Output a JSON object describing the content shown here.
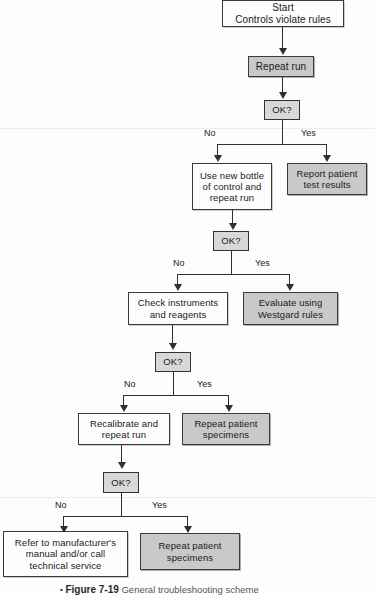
{
  "figure": {
    "bullet": "•",
    "number": "Figure 7-19",
    "caption": "General troubleshooting scheme"
  },
  "colors": {
    "shaded_fill": "#c9c9c9",
    "white_fill": "#fdfdfd",
    "decision_fill": "#d8d8d8",
    "line": "#2f2f2f",
    "border": "#3a3a3a"
  },
  "flowchart": {
    "type": "flowchart",
    "title": "General troubleshooting scheme",
    "nodes": [
      {
        "id": "start",
        "label": "Start\nControls violate rules",
        "shape": "process",
        "fill": "white"
      },
      {
        "id": "repeat_run",
        "label": "Repeat run",
        "shape": "process",
        "fill": "shaded"
      },
      {
        "id": "ok1",
        "label": "OK?",
        "shape": "decision",
        "fill": "shaded"
      },
      {
        "id": "new_bottle",
        "label": "Use new bottle\nof control and\nrepeat run",
        "shape": "process",
        "fill": "white"
      },
      {
        "id": "report",
        "label": "Report patient\ntest results",
        "shape": "process",
        "fill": "shaded"
      },
      {
        "id": "ok2",
        "label": "OK?",
        "shape": "decision",
        "fill": "shaded"
      },
      {
        "id": "check_inst",
        "label": "Check instruments\nand reagents",
        "shape": "process",
        "fill": "white"
      },
      {
        "id": "westgard",
        "label": "Evaluate using\nWestgard rules",
        "shape": "process",
        "fill": "shaded"
      },
      {
        "id": "ok3",
        "label": "OK?",
        "shape": "decision",
        "fill": "shaded"
      },
      {
        "id": "recalib",
        "label": "Recalibrate and\nrepeat run",
        "shape": "process",
        "fill": "white"
      },
      {
        "id": "repeat_sp1",
        "label": "Repeat patient\nspecimens",
        "shape": "process",
        "fill": "shaded"
      },
      {
        "id": "ok4",
        "label": "OK?",
        "shape": "decision",
        "fill": "shaded"
      },
      {
        "id": "refer",
        "label": "Refer to manufacturer's\nmanual and/or call\ntechnical service",
        "shape": "process",
        "fill": "white"
      },
      {
        "id": "repeat_sp2",
        "label": "Repeat patient\nspecimens",
        "shape": "process",
        "fill": "shaded"
      }
    ],
    "branch_labels": {
      "no": "No",
      "yes": "Yes"
    },
    "edges": [
      {
        "from": "start",
        "to": "repeat_run",
        "label": ""
      },
      {
        "from": "repeat_run",
        "to": "ok1",
        "label": ""
      },
      {
        "from": "ok1",
        "to": "new_bottle",
        "label": "No"
      },
      {
        "from": "ok1",
        "to": "report",
        "label": "Yes"
      },
      {
        "from": "new_bottle",
        "to": "ok2",
        "label": ""
      },
      {
        "from": "ok2",
        "to": "check_inst",
        "label": "No"
      },
      {
        "from": "ok2",
        "to": "westgard",
        "label": "Yes"
      },
      {
        "from": "check_inst",
        "to": "ok3",
        "label": ""
      },
      {
        "from": "ok3",
        "to": "recalib",
        "label": "No"
      },
      {
        "from": "ok3",
        "to": "repeat_sp1",
        "label": "Yes"
      },
      {
        "from": "recalib",
        "to": "ok4",
        "label": ""
      },
      {
        "from": "ok4",
        "to": "refer",
        "label": "No"
      },
      {
        "from": "ok4",
        "to": "repeat_sp2",
        "label": "Yes"
      }
    ]
  }
}
